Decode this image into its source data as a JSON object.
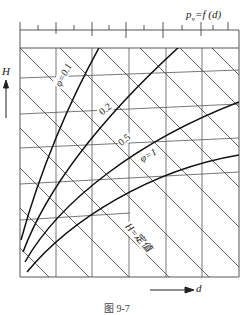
{
  "diagram": {
    "title_main": "p",
    "title_sub": "v",
    "title_rest": "=f (d)",
    "y_axis_label": "H",
    "x_axis_label": "d",
    "caption": "图 9-7",
    "curve_labels": [
      "φ=0.1",
      "0.2",
      "0.5",
      "φ=1"
    ],
    "isoline_label": "H=定值",
    "colors": {
      "line": "#222222",
      "grid": "#555555",
      "background": "#ffffff"
    }
  }
}
